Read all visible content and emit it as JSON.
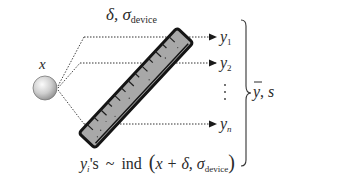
{
  "diagram": {
    "type": "measurement-model-schematic",
    "top_label": {
      "symbol": "δ, σ",
      "subscript": "device"
    },
    "object_label": "x",
    "outputs": [
      {
        "base": "y",
        "subscript": "1"
      },
      {
        "base": "y",
        "subscript": "2"
      },
      {
        "base": "⋮",
        "subscript": ""
      },
      {
        "base": "y",
        "subscript": "n"
      }
    ],
    "summary_label": {
      "mean": "y",
      "sep": ", ",
      "sd": "s"
    },
    "formula": {
      "lhs_base": "y",
      "lhs_sub": "i",
      "lhs_rest": "'s",
      "tilde": "~",
      "dist": "ind",
      "open": "(",
      "arg1": "x + δ, σ",
      "arg_sub": "device",
      "close": ")"
    },
    "colors": {
      "ruler_fill": "#a9a9a9",
      "ruler_edge": "#1a1a1a",
      "ball_light": "#f4f4f4",
      "ball_dark": "#9a9a9a",
      "line": "#333333"
    }
  }
}
